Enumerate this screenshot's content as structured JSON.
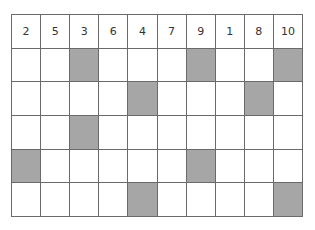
{
  "grid": {
    "header": [
      "2",
      "5",
      "3",
      "6",
      "4",
      "7",
      "9",
      "1",
      "8",
      "10"
    ],
    "shaded_color": "#a6a6a6",
    "rows": [
      [
        0,
        0,
        1,
        0,
        0,
        0,
        1,
        0,
        0,
        1
      ],
      [
        0,
        0,
        0,
        0,
        1,
        0,
        0,
        0,
        1,
        0
      ],
      [
        0,
        0,
        1,
        0,
        0,
        0,
        0,
        0,
        0,
        0
      ],
      [
        1,
        0,
        0,
        0,
        0,
        0,
        1,
        0,
        0,
        0
      ],
      [
        0,
        0,
        0,
        0,
        1,
        0,
        0,
        0,
        0,
        1
      ]
    ]
  }
}
